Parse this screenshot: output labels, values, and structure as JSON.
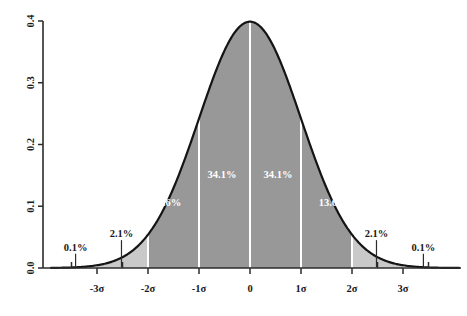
{
  "chart_data": {
    "type": "area",
    "title": "",
    "subtitle": "",
    "xlabel": "",
    "ylabel": "",
    "curve": {
      "name": "standard normal pdf",
      "mean": 0,
      "sigma": 1,
      "peak_value": 0.3989
    },
    "x": [
      -3.6,
      -3.4,
      -3.2,
      -3.0,
      -2.8,
      -2.6,
      -2.4,
      -2.2,
      -2.0,
      -1.8,
      -1.6,
      -1.4,
      -1.2,
      -1.0,
      -0.8,
      -0.6,
      -0.4,
      -0.2,
      0.0,
      0.2,
      0.4,
      0.6,
      0.8,
      1.0,
      1.2,
      1.4,
      1.6,
      1.8,
      2.0,
      2.2,
      2.4,
      2.6,
      2.8,
      3.0,
      3.2,
      3.4,
      3.6
    ],
    "y": [
      0.0006,
      0.0012,
      0.0024,
      0.0044,
      0.0079,
      0.0136,
      0.0224,
      0.0355,
      0.054,
      0.079,
      0.1109,
      0.1497,
      0.1942,
      0.242,
      0.2897,
      0.3332,
      0.3683,
      0.391,
      0.3989,
      0.391,
      0.3683,
      0.3332,
      0.2897,
      0.242,
      0.1942,
      0.1497,
      0.1109,
      0.079,
      0.054,
      0.0355,
      0.0224,
      0.0136,
      0.0079,
      0.0044,
      0.0024,
      0.0012,
      0.0006
    ],
    "xlim": [
      -3.9,
      4.1
    ],
    "ylim": [
      0.0,
      0.4
    ],
    "grid": false,
    "legend": null,
    "x_ticks": [
      {
        "value": -3,
        "label": "-3σ"
      },
      {
        "value": -2,
        "label": "-2σ"
      },
      {
        "value": -1,
        "label": "-1σ"
      },
      {
        "value": 0,
        "label": "0"
      },
      {
        "value": 1,
        "label": "1σ"
      },
      {
        "value": 2,
        "label": "2σ"
      },
      {
        "value": 3,
        "label": "3σ"
      }
    ],
    "y_ticks": [
      {
        "value": 0.0,
        "label": "0.0"
      },
      {
        "value": 0.1,
        "label": "0.1"
      },
      {
        "value": 0.2,
        "label": "0.2"
      },
      {
        "value": 0.3,
        "label": "0.3"
      },
      {
        "value": 0.4,
        "label": "0.4"
      }
    ],
    "minor_x_ticks": [
      -3.5,
      -2.5,
      2.5,
      3.5
    ],
    "bands": [
      {
        "id": "left-tail",
        "from": -3.9,
        "to": -3.0,
        "label": "0.1%",
        "percent": 0.1,
        "fill": "none",
        "label_color": "dark"
      },
      {
        "id": "left-2sigma",
        "from": -3.0,
        "to": -2.0,
        "label": "2.1%",
        "percent": 2.1,
        "fill": "#c9c9c9",
        "label_color": "dark"
      },
      {
        "id": "left-1sigma",
        "from": -2.0,
        "to": -1.0,
        "label": "13.6%",
        "percent": 13.6,
        "fill": "#989898",
        "label_color": "white"
      },
      {
        "id": "left-center",
        "from": -1.0,
        "to": 0.0,
        "label": "34.1%",
        "percent": 34.1,
        "fill": "#989898",
        "label_color": "white"
      },
      {
        "id": "right-center",
        "from": 0.0,
        "to": 1.0,
        "label": "34.1%",
        "percent": 34.1,
        "fill": "#989898",
        "label_color": "white"
      },
      {
        "id": "right-1sigma",
        "from": 1.0,
        "to": 2.0,
        "label": "13.6%",
        "percent": 13.6,
        "fill": "#989898",
        "label_color": "white"
      },
      {
        "id": "right-2sigma",
        "from": 2.0,
        "to": 3.0,
        "label": "2.1%",
        "percent": 2.1,
        "fill": "#c9c9c9",
        "label_color": "dark"
      },
      {
        "id": "right-tail",
        "from": 3.0,
        "to": 3.9,
        "label": "0.1%",
        "percent": 0.1,
        "fill": "none",
        "label_color": "dark"
      }
    ],
    "inner_labels": [
      {
        "id": "pct-13-6-left",
        "text": "13.6%",
        "x": -1.63,
        "y": 0.1
      },
      {
        "id": "pct-34-1-left",
        "text": "34.1%",
        "x": -0.55,
        "y": 0.145
      },
      {
        "id": "pct-34-1-right",
        "text": "34.1%",
        "x": 0.55,
        "y": 0.145
      },
      {
        "id": "pct-13-6-right",
        "text": "13.6%",
        "x": 1.63,
        "y": 0.1
      }
    ],
    "outer_labels": [
      {
        "id": "pct-0-1-left",
        "text": "0.1%",
        "x": -3.42,
        "y": 0.028,
        "leader_to_x": -3.42
      },
      {
        "id": "pct-2-1-left",
        "text": "2.1%",
        "x": -2.52,
        "y": 0.05,
        "leader_to_x": -2.52
      },
      {
        "id": "pct-2-1-right",
        "text": "2.1%",
        "x": 2.48,
        "y": 0.05,
        "leader_to_x": 2.48
      },
      {
        "id": "pct-0-1-right",
        "text": "0.1%",
        "x": 3.4,
        "y": 0.028,
        "leader_to_x": 3.4
      }
    ],
    "dividers": [
      -2,
      -1,
      0,
      1,
      2
    ],
    "colors": {
      "fill_inner": "#989898",
      "fill_outer": "#c9c9c9",
      "curve": "#141414",
      "axis": "#2b2b2b",
      "divider": "#ffffff",
      "background": "#ffffff",
      "label_dark": "#1a1a1a",
      "label_light": "#ffffff"
    }
  }
}
